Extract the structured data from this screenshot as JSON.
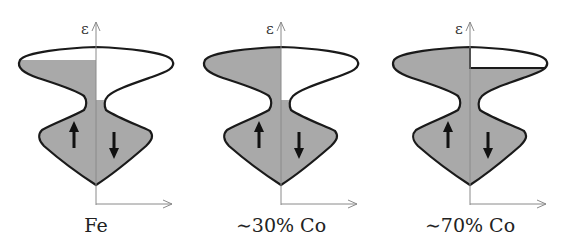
{
  "diagram": {
    "type": "spin-resolved density of states schematic",
    "axis_label_energy": "ε",
    "colors": {
      "fill": "#a9a9a9",
      "outline": "#1a1a1a",
      "axis": "#8a8a8a",
      "arrow": "#111111"
    },
    "panels": [
      {
        "label": "Fe",
        "spin_up_symbol": "up-arrow",
        "spin_down_symbol": "down-arrow",
        "majority_filled": "partial (top of upper lobe empty)",
        "minority_filled": "below neck only"
      },
      {
        "label": "~30% Co",
        "spin_up_symbol": "up-arrow",
        "spin_down_symbol": "down-arrow",
        "majority_filled": "fully filled",
        "minority_filled": "below neck only"
      },
      {
        "label": "~70% Co",
        "spin_up_symbol": "up-arrow",
        "spin_down_symbol": "down-arrow",
        "majority_filled": "fully filled",
        "minority_filled": "filled up to upper lobe, small empty region at top"
      }
    ]
  }
}
